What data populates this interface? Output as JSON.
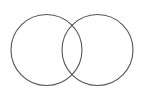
{
  "diagram": {
    "type": "venn",
    "stroke_color": "#555555",
    "background": "#ffffff",
    "circles": [
      {
        "name": "left",
        "cx": 46.5,
        "cy": 50,
        "r": 35.5
      },
      {
        "name": "right",
        "cx": 97.5,
        "cy": 50,
        "r": 35.5
      }
    ]
  }
}
